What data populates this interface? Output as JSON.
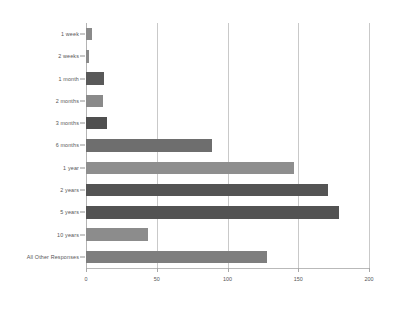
{
  "chart_data": {
    "type": "bar",
    "orientation": "horizontal",
    "title": "",
    "subtitle": "",
    "xlabel": "",
    "ylabel": "",
    "xlim": [
      0,
      200
    ],
    "grid": true,
    "legend": "none",
    "xticks": [
      "0",
      "50",
      "100",
      "150",
      "200"
    ],
    "categories": [
      "1 week",
      "2 weeks",
      "1 month",
      "2 months",
      "3 months",
      "6 months",
      "1 year",
      "2 years",
      "5 years",
      "10 years",
      "All Other Responses"
    ],
    "values": [
      4,
      2,
      13,
      12,
      15,
      89,
      147,
      171,
      179,
      44,
      128
    ],
    "bar_colors": [
      "#8a8a8a",
      "#8a8a8a",
      "#595959",
      "#8a8a8a",
      "#4f4f4f",
      "#6e6e6e",
      "#8e8e8e",
      "#545454",
      "#535353",
      "#8c8c8c",
      "#7e7e7e"
    ]
  },
  "style": {
    "background": "#ffffff",
    "gridline_color": "#c9c9c9",
    "axis_color": "#b4b4b4",
    "text_color": "#555555"
  }
}
